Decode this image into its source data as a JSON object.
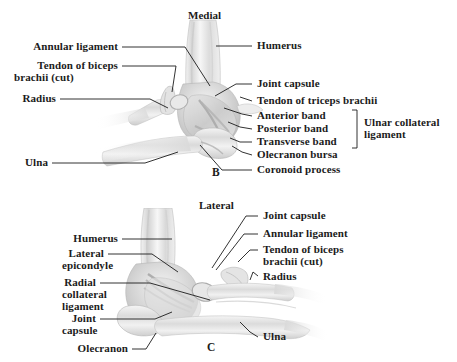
{
  "figure": {
    "background_color": "#ffffff",
    "text_color": "#1b1b1b",
    "leader_color": "#1b1b1b"
  },
  "panels": [
    {
      "letter": "B",
      "orientation": "Medial",
      "labels_left": [
        {
          "text": "Annular ligament"
        },
        {
          "text": "Tendon of biceps"
        },
        {
          "text": "brachii (cut)"
        },
        {
          "text": "Radius"
        },
        {
          "text": "Ulna"
        }
      ],
      "labels_right": [
        {
          "text": "Humerus"
        },
        {
          "text": "Joint capsule"
        },
        {
          "text": "Tendon of triceps brachii"
        },
        {
          "text": "Anterior band"
        },
        {
          "text": "Posterior band"
        },
        {
          "text": "Transverse band"
        },
        {
          "text": "Olecranon bursa"
        },
        {
          "text": "Coronoid process"
        }
      ],
      "bracket_group": {
        "line1": "Ulnar collateral",
        "line2": "ligament"
      }
    },
    {
      "letter": "C",
      "orientation": "Lateral",
      "labels_left": [
        {
          "text": "Humerus"
        },
        {
          "text": "Lateral"
        },
        {
          "text": "epicondyle"
        },
        {
          "text": "Radial"
        },
        {
          "text": "collateral"
        },
        {
          "text": "ligament"
        },
        {
          "text": "Joint"
        },
        {
          "text": "capsule"
        },
        {
          "text": "Olecranon"
        }
      ],
      "labels_right": [
        {
          "text": "Joint capsule"
        },
        {
          "text": "Annular ligament"
        },
        {
          "text": "Tendon of biceps"
        },
        {
          "text": "brachii (cut)"
        },
        {
          "text": "Radius"
        },
        {
          "text": "Ulna"
        }
      ]
    }
  ],
  "text": {
    "b_annular_ligament": "Annular ligament",
    "b_tendon_biceps_1": "Tendon of biceps",
    "b_tendon_biceps_2": "brachii (cut)",
    "b_radius": "Radius",
    "b_ulna": "Ulna",
    "b_humerus": "Humerus",
    "b_joint_capsule": "Joint capsule",
    "b_tendon_triceps": "Tendon of triceps brachii",
    "b_anterior_band": "Anterior band",
    "b_posterior_band": "Posterior band",
    "b_transverse_band": "Transverse band",
    "b_olecranon_bursa": "Olecranon bursa",
    "b_coronoid_process": "Coronoid process",
    "b_ucl_1": "Ulnar collateral",
    "b_ucl_2": "ligament",
    "b_medial": "Medial",
    "b_letter": "B",
    "c_humerus": "Humerus",
    "c_lateral_1": "Lateral",
    "c_lateral_2": "epicondyle",
    "c_rcl_1": "Radial",
    "c_rcl_2": "collateral",
    "c_rcl_3": "ligament",
    "c_joint_1": "Joint",
    "c_joint_2": "capsule",
    "c_olecranon": "Olecranon",
    "c_joint_capsule": "Joint capsule",
    "c_annular_ligament": "Annular ligament",
    "c_tendon_biceps_1": "Tendon of biceps",
    "c_tendon_biceps_2": "brachii (cut)",
    "c_radius": "Radius",
    "c_ulna": "Ulna",
    "c_lateral_orient": "Lateral",
    "c_letter": "C"
  }
}
